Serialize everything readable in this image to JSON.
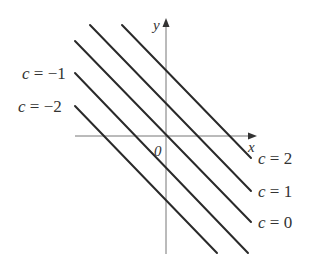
{
  "diagram": {
    "type": "level-curves",
    "axes": {
      "x_label": "x",
      "y_label": "y",
      "origin_label": "0",
      "axis_color": "#777777"
    },
    "line_color": "#2a2a2a",
    "lines": [
      {
        "c": 2,
        "label": "c = 2",
        "x1": 122,
        "y1": 25,
        "x2": 251,
        "y2": 158
      },
      {
        "c": 1,
        "label": "c = 1",
        "x1": 90,
        "y1": 25,
        "x2": 251,
        "y2": 191
      },
      {
        "c": 0,
        "label": "c = 0",
        "x1": 75,
        "y1": 41,
        "x2": 251,
        "y2": 222
      },
      {
        "c": -1,
        "label": "c = −1",
        "x1": 75,
        "y1": 73,
        "x2": 248,
        "y2": 253
      },
      {
        "c": -2,
        "label": "c = −2",
        "x1": 75,
        "y1": 106,
        "x2": 217,
        "y2": 253
      }
    ],
    "labels": {
      "c2": {
        "var": "c",
        "rest": " = 2"
      },
      "c1": {
        "var": "c",
        "rest": " = 1"
      },
      "c0": {
        "var": "c",
        "rest": " = 0"
      },
      "cm1": {
        "var": "c",
        "rest": " = −1"
      },
      "cm2": {
        "var": "c",
        "rest": " = −2"
      }
    }
  }
}
